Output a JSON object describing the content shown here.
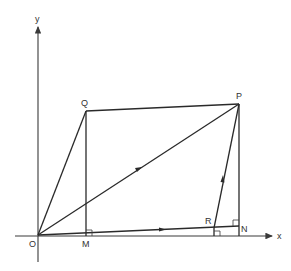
{
  "diagram": {
    "type": "vector-geometry",
    "axes": {
      "x_label": "x",
      "y_label": "y",
      "origin_label": "O"
    },
    "points": {
      "O": {
        "label": "O",
        "x": 38,
        "y": 235
      },
      "Q": {
        "label": "Q",
        "x": 86,
        "y": 111
      },
      "P": {
        "label": "P",
        "x": 239,
        "y": 104
      },
      "M": {
        "label": "M",
        "x": 86,
        "y": 235
      },
      "N": {
        "label": "N",
        "x": 239,
        "y": 226
      },
      "R": {
        "label": "R",
        "x": 214,
        "y": 228
      }
    },
    "segments": [
      {
        "from": "O",
        "to": "Q"
      },
      {
        "from": "Q",
        "to": "P"
      },
      {
        "from": "O",
        "to": "P",
        "arrow": true
      },
      {
        "from": "Q",
        "to": "M"
      },
      {
        "from": "P",
        "to": "N"
      },
      {
        "from": "O",
        "to": "N",
        "arrow": true
      },
      {
        "from": "R",
        "to": "P",
        "arrow": true
      }
    ],
    "right_angles": [
      "M",
      "N",
      "R-foot"
    ],
    "colors": {
      "line": "#2a2a2a",
      "text": "#333333",
      "background": "#ffffff"
    }
  }
}
